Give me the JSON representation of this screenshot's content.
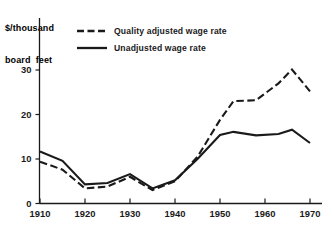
{
  "chart_data": {
    "type": "line",
    "title": "",
    "subtitle": "",
    "xlabel": "",
    "ylabel": "$/thousand\nboard feet",
    "ylabel_line1": "$/thousand",
    "ylabel_line2": "board feet",
    "xlim": [
      1910,
      1971
    ],
    "ylim": [
      0,
      34
    ],
    "grid": false,
    "legend_position": "top-center",
    "xticks": [
      1910,
      1920,
      1930,
      1940,
      1950,
      1960,
      1970
    ],
    "xtick_labels": [
      "1910",
      "1920",
      "1930",
      "1940",
      "1950",
      "1960",
      "1970"
    ],
    "yticks": [
      0,
      10,
      20,
      30
    ],
    "ytick_labels": [
      "0",
      "10",
      "20",
      "30"
    ],
    "series": [
      {
        "name": "Quality adjusted wage rate",
        "style": "dashed",
        "color": "#1a1a1a",
        "x": [
          1910,
          1915,
          1920,
          1925,
          1930,
          1935,
          1940,
          1945,
          1950,
          1953,
          1958,
          1963,
          1966,
          1970
        ],
        "values": [
          9.4,
          7.6,
          3.4,
          3.8,
          6.0,
          3.0,
          5.0,
          10.5,
          18.8,
          23.0,
          23.2,
          27.0,
          30.1,
          25.2
        ]
      },
      {
        "name": "Unadjusted wage rate",
        "style": "solid",
        "color": "#1a1a1a",
        "x": [
          1910,
          1915,
          1920,
          1925,
          1930,
          1935,
          1940,
          1945,
          1950,
          1953,
          1958,
          1963,
          1966,
          1970
        ],
        "values": [
          11.7,
          9.6,
          4.3,
          4.6,
          6.6,
          3.4,
          5.2,
          10.0,
          15.4,
          16.1,
          15.3,
          15.6,
          16.6,
          13.6
        ]
      }
    ]
  },
  "legend": {
    "entries": [
      {
        "label": "Quality adjusted wage rate",
        "style": "dashed"
      },
      {
        "label": "Unadjusted wage rate",
        "style": "solid"
      }
    ]
  },
  "axis": {
    "y_title_line1": "$/thousand",
    "y_title_line2": "board  feet"
  }
}
